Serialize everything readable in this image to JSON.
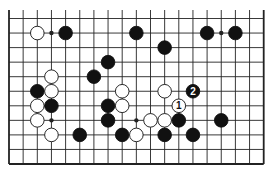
{
  "diagram": {
    "type": "go-board-fragment",
    "columns": 19,
    "rows": 11,
    "grid": {
      "x0": 9,
      "dx": 14.15,
      "y0": 18.5,
      "dy": 14.55
    },
    "colors": {
      "line": "#222222",
      "black": "#111111",
      "white": "#ffffff",
      "background": "#ffffff"
    },
    "star_points": [
      [
        3,
        1
      ],
      [
        15,
        1
      ],
      [
        9,
        7
      ],
      [
        3,
        7
      ]
    ],
    "stones": [
      {
        "c": 2,
        "r": 1,
        "color": "white"
      },
      {
        "c": 4,
        "r": 1,
        "color": "black"
      },
      {
        "c": 9,
        "r": 1,
        "color": "black"
      },
      {
        "c": 14,
        "r": 1,
        "color": "black"
      },
      {
        "c": 16,
        "r": 1,
        "color": "black"
      },
      {
        "c": 11,
        "r": 2,
        "color": "black"
      },
      {
        "c": 7,
        "r": 3,
        "color": "black"
      },
      {
        "c": 3,
        "r": 4,
        "color": "white"
      },
      {
        "c": 6,
        "r": 4,
        "color": "black"
      },
      {
        "c": 2,
        "r": 5,
        "color": "black"
      },
      {
        "c": 3,
        "r": 5,
        "color": "white"
      },
      {
        "c": 8,
        "r": 5,
        "color": "white"
      },
      {
        "c": 11,
        "r": 5,
        "color": "white"
      },
      {
        "c": 13,
        "r": 5,
        "color": "black",
        "label": "2"
      },
      {
        "c": 2,
        "r": 6,
        "color": "white"
      },
      {
        "c": 3,
        "r": 6,
        "color": "black"
      },
      {
        "c": 7,
        "r": 6,
        "color": "black"
      },
      {
        "c": 8,
        "r": 6,
        "color": "white"
      },
      {
        "c": 12,
        "r": 6,
        "color": "white",
        "label": "1"
      },
      {
        "c": 2,
        "r": 7,
        "color": "white"
      },
      {
        "c": 7,
        "r": 7,
        "color": "black"
      },
      {
        "c": 10,
        "r": 7,
        "color": "white"
      },
      {
        "c": 11,
        "r": 7,
        "color": "white"
      },
      {
        "c": 12,
        "r": 7,
        "color": "black"
      },
      {
        "c": 15,
        "r": 7,
        "color": "black"
      },
      {
        "c": 3,
        "r": 8,
        "color": "white"
      },
      {
        "c": 5,
        "r": 8,
        "color": "black"
      },
      {
        "c": 8,
        "r": 8,
        "color": "black"
      },
      {
        "c": 9,
        "r": 8,
        "color": "white"
      },
      {
        "c": 11,
        "r": 8,
        "color": "black"
      },
      {
        "c": 13,
        "r": 8,
        "color": "black"
      }
    ]
  }
}
